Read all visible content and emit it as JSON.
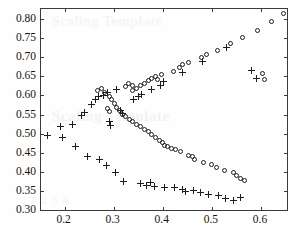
{
  "figure": {
    "background_color": "#fefefe",
    "axis_color": "#3b3b3b",
    "marker_color": "#1d1d1d",
    "watermarks": [
      {
        "text": "Scaling Template",
        "x": 52,
        "y": 108,
        "size": 15,
        "opacity": 0.55
      },
      {
        "text": "Scaling Template",
        "x": 52,
        "y": 14,
        "size": 14,
        "opacity": 0.4
      },
      {
        "text": "1 2 3 4",
        "x": 30,
        "y": 192,
        "size": 13,
        "opacity": 0.35
      }
    ]
  },
  "chart_data": {
    "type": "scatter",
    "title": "",
    "xlabel": "",
    "ylabel": "",
    "xlim": [
      0.152,
      0.657
    ],
    "ylim": [
      0.295,
      0.826
    ],
    "grid": false,
    "legend": "none",
    "x_ticks": [
      0.2,
      0.3,
      0.4,
      0.5,
      0.6
    ],
    "x_tick_labels": [
      "0.2",
      "0.3",
      "0.4",
      "0.5",
      "0.6"
    ],
    "y_ticks": [
      0.3,
      0.35,
      0.4,
      0.45,
      0.5,
      0.55,
      0.6,
      0.65,
      0.7,
      0.75,
      0.8
    ],
    "y_tick_labels": [
      "0.30",
      "0.35",
      "0.40",
      "0.45",
      "0.50",
      "0.55",
      "0.60",
      "0.65",
      "0.70",
      "0.75",
      "0.80"
    ],
    "series": [
      {
        "name": "circle-series",
        "marker": "circle",
        "points": [
          [
            0.267,
            0.613
          ],
          [
            0.276,
            0.617
          ],
          [
            0.281,
            0.607
          ],
          [
            0.292,
            0.596
          ],
          [
            0.296,
            0.588
          ],
          [
            0.302,
            0.578
          ],
          [
            0.305,
            0.569
          ],
          [
            0.312,
            0.56
          ],
          [
            0.318,
            0.551
          ],
          [
            0.325,
            0.544
          ],
          [
            0.332,
            0.537
          ],
          [
            0.339,
            0.531
          ],
          [
            0.347,
            0.525
          ],
          [
            0.355,
            0.519
          ],
          [
            0.362,
            0.512
          ],
          [
            0.37,
            0.505
          ],
          [
            0.378,
            0.498
          ],
          [
            0.386,
            0.491
          ],
          [
            0.393,
            0.483
          ],
          [
            0.399,
            0.477
          ],
          [
            0.404,
            0.47
          ],
          [
            0.41,
            0.466
          ],
          [
            0.417,
            0.462
          ],
          [
            0.425,
            0.459
          ],
          [
            0.437,
            0.452
          ],
          [
            0.452,
            0.444
          ],
          [
            0.461,
            0.439
          ],
          [
            0.464,
            0.432
          ],
          [
            0.483,
            0.424
          ],
          [
            0.5,
            0.418
          ],
          [
            0.509,
            0.412
          ],
          [
            0.525,
            0.404
          ],
          [
            0.543,
            0.398
          ],
          [
            0.551,
            0.39
          ],
          [
            0.558,
            0.383
          ],
          [
            0.566,
            0.377
          ],
          [
            0.324,
            0.624
          ],
          [
            0.331,
            0.632
          ],
          [
            0.338,
            0.625
          ],
          [
            0.339,
            0.612
          ],
          [
            0.347,
            0.618
          ],
          [
            0.354,
            0.625
          ],
          [
            0.363,
            0.63
          ],
          [
            0.37,
            0.638
          ],
          [
            0.378,
            0.643
          ],
          [
            0.385,
            0.649
          ],
          [
            0.389,
            0.641
          ],
          [
            0.397,
            0.655
          ],
          [
            0.421,
            0.662
          ],
          [
            0.434,
            0.673
          ],
          [
            0.441,
            0.68
          ],
          [
            0.452,
            0.687
          ],
          [
            0.478,
            0.7
          ],
          [
            0.49,
            0.707
          ],
          [
            0.512,
            0.718
          ],
          [
            0.537,
            0.736
          ],
          [
            0.563,
            0.752
          ],
          [
            0.593,
            0.771
          ],
          [
            0.622,
            0.792
          ],
          [
            0.646,
            0.814
          ],
          [
            0.604,
            0.657
          ],
          [
            0.607,
            0.641
          ],
          [
            0.287,
            0.566
          ],
          [
            0.292,
            0.559
          ]
        ]
      },
      {
        "name": "plus-series",
        "marker": "plus",
        "points": [
          [
            0.165,
            0.496
          ],
          [
            0.192,
            0.519
          ],
          [
            0.196,
            0.49
          ],
          [
            0.222,
            0.466
          ],
          [
            0.246,
            0.441
          ],
          [
            0.272,
            0.432
          ],
          [
            0.285,
            0.416
          ],
          [
            0.304,
            0.399
          ],
          [
            0.32,
            0.375
          ],
          [
            0.354,
            0.369
          ],
          [
            0.366,
            0.364
          ],
          [
            0.374,
            0.371
          ],
          [
            0.383,
            0.363
          ],
          [
            0.404,
            0.358
          ],
          [
            0.424,
            0.36
          ],
          [
            0.44,
            0.355
          ],
          [
            0.447,
            0.349
          ],
          [
            0.462,
            0.352
          ],
          [
            0.476,
            0.346
          ],
          [
            0.494,
            0.342
          ],
          [
            0.514,
            0.338
          ],
          [
            0.528,
            0.331
          ],
          [
            0.545,
            0.326
          ],
          [
            0.558,
            0.333
          ],
          [
            0.216,
            0.525
          ],
          [
            0.234,
            0.548
          ],
          [
            0.24,
            0.554
          ],
          [
            0.255,
            0.575
          ],
          [
            0.262,
            0.589
          ],
          [
            0.27,
            0.597
          ],
          [
            0.279,
            0.6
          ],
          [
            0.288,
            0.607
          ],
          [
            0.306,
            0.616
          ],
          [
            0.292,
            0.531
          ],
          [
            0.293,
            0.522
          ],
          [
            0.314,
            0.56
          ],
          [
            0.318,
            0.552
          ],
          [
            0.341,
            0.588
          ],
          [
            0.35,
            0.596
          ],
          [
            0.356,
            0.602
          ],
          [
            0.376,
            0.615
          ],
          [
            0.395,
            0.627
          ],
          [
            0.402,
            0.636
          ],
          [
            0.44,
            0.661
          ],
          [
            0.48,
            0.688
          ],
          [
            0.53,
            0.725
          ],
          [
            0.58,
            0.665
          ],
          [
            0.59,
            0.643
          ]
        ]
      }
    ]
  }
}
